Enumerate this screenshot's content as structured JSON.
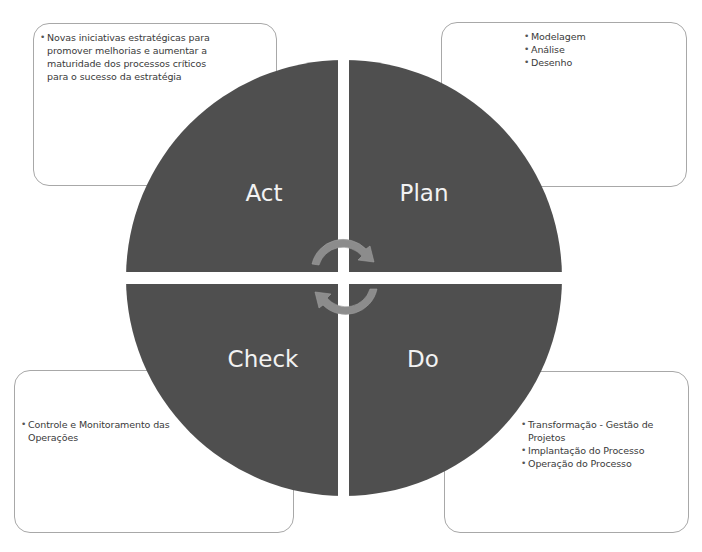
{
  "diagram": {
    "colors": {
      "quadrant_fill": "#4f4f4f",
      "quadrant_text": "#f2f2f2",
      "arrow_fill": "#8c8c8c",
      "box_border": "#a8a8a8",
      "text": "#3a3a3a"
    },
    "quadrants": {
      "act": {
        "label": "Act"
      },
      "plan": {
        "label": "Plan"
      },
      "check": {
        "label": "Check"
      },
      "do": {
        "label": "Do"
      }
    },
    "boxes": {
      "act": {
        "items": [
          "Novas iniciativas estratégicas para promover melhorias e aumentar a maturidade dos processos críticos para o sucesso da estratégia"
        ]
      },
      "plan": {
        "items": [
          "Modelagem",
          "Análise",
          "Desenho"
        ]
      },
      "check": {
        "items": [
          "Controle e Monitoramento das Operações"
        ]
      },
      "do": {
        "items": [
          "Transformação - Gestão de Projetos",
          "Implantação do Processo",
          "Operação do Processo"
        ]
      }
    },
    "center_icon": "cycle-arrows-icon"
  }
}
